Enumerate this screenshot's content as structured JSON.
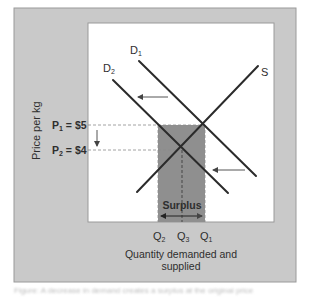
{
  "figure": {
    "y_axis_label": "Price per kg",
    "x_axis_label_line1": "Quantity demanded and",
    "x_axis_label_line2": "supplied",
    "price_labels": [
      {
        "main": "P",
        "sub": "1",
        "value": " = $5"
      },
      {
        "main": "P",
        "sub": "2",
        "value": " = $4"
      }
    ],
    "quantity_labels": [
      {
        "main": "Q",
        "sub": "2"
      },
      {
        "main": "Q",
        "sub": "3"
      },
      {
        "main": "Q",
        "sub": "1"
      }
    ],
    "curve_labels": {
      "d1": {
        "main": "D",
        "sub": "1"
      },
      "d2": {
        "main": "D",
        "sub": "2"
      },
      "s": {
        "main": "S"
      }
    },
    "surplus_label": "Surplus",
    "caption": "Figure: A decrease in demand creates a surplus at the original price"
  },
  "colors": {
    "frame_bg": "#c9c9c9",
    "frame_border": "#9a9a9a",
    "plot_bg": "#ffffff",
    "line": "#2b2b2b",
    "shade": "#8f8f8f",
    "dashed": "#8a8a8a",
    "arrow": "#555555",
    "text": "#2e2e2e"
  }
}
